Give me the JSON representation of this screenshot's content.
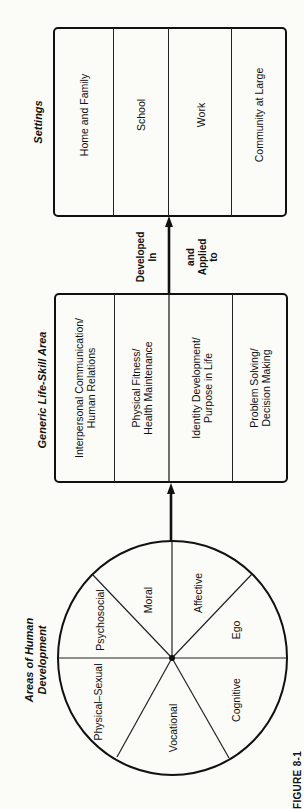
{
  "figure_label": "FIGURE 8-1",
  "settings": {
    "title": "Settings",
    "items": [
      {
        "label": "Home and Family"
      },
      {
        "label": "School"
      },
      {
        "label": "Work"
      },
      {
        "label": "Community at Large"
      }
    ]
  },
  "connector": {
    "left_line1": "Developed",
    "left_line2": "In",
    "right_line1": "and",
    "right_line2": "Applied",
    "right_line3": "to"
  },
  "life_skills": {
    "title": "Generic Life-Skill Area",
    "items": [
      {
        "line1": "Interpersonal Communication/",
        "line2": "Human Relations"
      },
      {
        "line1": "Physical Fitness/",
        "line2": "Health Maintenance"
      },
      {
        "line1": "Identity Development/",
        "line2": "Purpose in Life"
      },
      {
        "line1": "Problem Solving/",
        "line2": "Decision Making"
      }
    ]
  },
  "human_development": {
    "title_line1": "Areas of Human",
    "title_line2": "Development",
    "segments": [
      {
        "label": "Moral"
      },
      {
        "label": "Affective"
      },
      {
        "label": "Ego"
      },
      {
        "label": "Cognitive"
      },
      {
        "label": "Vocational"
      },
      {
        "label": "Physical–Sexual"
      },
      {
        "label": "Psychosocial"
      }
    ]
  }
}
